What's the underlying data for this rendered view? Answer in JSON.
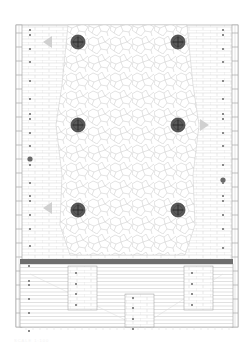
{
  "drawing": {
    "type": "floor-plan",
    "width": 250,
    "height": 352,
    "colors": {
      "background": "#ffffff",
      "line": "#c8c8c8",
      "outline": "#9a9a9a",
      "paving": "#d6d6d6",
      "medallion_fill": "#5a5a5a",
      "medallion_cross": "#2a2a2a",
      "band": "#6e6e6e",
      "post": "#8a8a8a",
      "arrow": "#d0d0d0"
    },
    "site": {
      "x": 16,
      "y": 25,
      "w": 222,
      "h": 302
    },
    "edge_strips": [
      {
        "name": "left-edge-strip",
        "x": 16,
        "y": 25,
        "w": 6,
        "h": 302
      },
      {
        "name": "right-edge-strip",
        "x": 232,
        "y": 25,
        "w": 6,
        "h": 302
      }
    ],
    "central_paving": {
      "x": 60,
      "y": 25,
      "w": 135,
      "h": 230
    },
    "medallions": [
      {
        "cx": 78,
        "cy": 42,
        "r": 7
      },
      {
        "cx": 178,
        "cy": 42,
        "r": 7
      },
      {
        "cx": 78,
        "cy": 125,
        "r": 7
      },
      {
        "cx": 178,
        "cy": 125,
        "r": 7
      },
      {
        "cx": 78,
        "cy": 210,
        "r": 7
      },
      {
        "cx": 178,
        "cy": 210,
        "r": 7
      }
    ],
    "arrows": [
      {
        "x": 48,
        "y": 42,
        "dir": "left"
      },
      {
        "x": 204,
        "y": 125,
        "dir": "right"
      },
      {
        "x": 48,
        "y": 208,
        "dir": "left"
      }
    ],
    "large_dots": [
      {
        "cx": 30,
        "cy": 159
      },
      {
        "cx": 223,
        "cy": 180
      }
    ],
    "left_dots_y": [
      30,
      35,
      49,
      62,
      81,
      99,
      114,
      119,
      133,
      146,
      165,
      183,
      196,
      201,
      215,
      229,
      246
    ],
    "right_dots_y": [
      30,
      35,
      49,
      62,
      81,
      99,
      114,
      119,
      133,
      146,
      165,
      183,
      196,
      201,
      215,
      229,
      248
    ],
    "band": {
      "x": 20,
      "y": 259,
      "w": 213,
      "h": 5
    },
    "lower_area": {
      "x": 20,
      "y": 264,
      "w": 213,
      "h": 63,
      "line_spacing": 3.5,
      "panels": [
        {
          "x": 68,
          "y": 266,
          "w": 29,
          "h": 44,
          "dots_y": [
            273,
            284,
            294,
            305
          ]
        },
        {
          "x": 125,
          "y": 294,
          "w": 29,
          "h": 33,
          "dots_y": [
            298,
            308,
            319,
            329
          ]
        },
        {
          "x": 184,
          "y": 266,
          "w": 29,
          "h": 44,
          "dots_y": [
            273,
            284,
            294,
            305
          ]
        }
      ],
      "left_dots_y": [
        266,
        281,
        285,
        299,
        313,
        331
      ]
    },
    "caption": "SCALE 1:100"
  }
}
